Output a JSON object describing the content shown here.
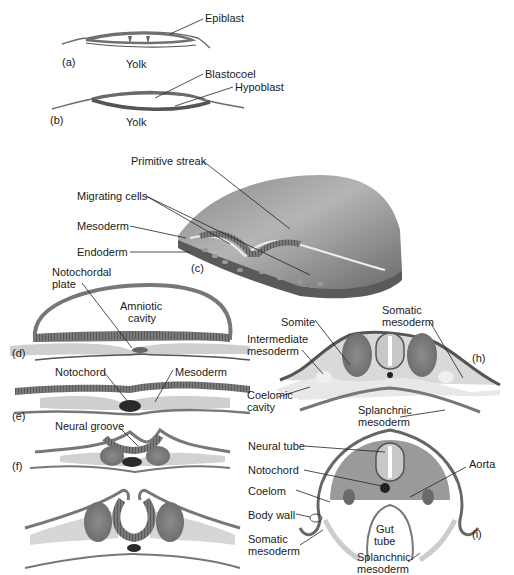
{
  "figure": {
    "panels": {
      "a": {
        "tag": "(a)",
        "yolk": "Yolk",
        "epiblast": "Epiblast"
      },
      "b": {
        "tag": "(b)",
        "yolk": "Yolk",
        "blastocoel": "Blastocoel",
        "hypoblast": "Hypoblast"
      },
      "c": {
        "tag": "(c)",
        "primitive_streak": "Primitive streak",
        "migrating_cells": "Migrating cells",
        "mesoderm": "Mesoderm",
        "endoderm": "Endoderm"
      },
      "d": {
        "tag": "(d)",
        "notochordal_plate_1": "Notochordal",
        "notochordal_plate_2": "plate",
        "amniotic_1": "Amniotic",
        "amniotic_2": "cavity"
      },
      "e": {
        "tag": "(e)",
        "notochord": "Notochord",
        "mesoderm": "Mesoderm"
      },
      "f": {
        "tag": "(f)",
        "neural_groove": "Neural groove"
      },
      "h": {
        "tag": "(h)",
        "somite": "Somite",
        "somatic_1": "Somatic",
        "somatic_2": "mesoderm",
        "intermediate_1": "Intermediate",
        "intermediate_2": "mesoderm",
        "coelomic_1": "Coelomic",
        "coelomic_2": "cavity",
        "splanchnic_1": "Splanchnic",
        "splanchnic_2": "mesoderm"
      },
      "i": {
        "tag": "(i)",
        "neural_tube": "Neural tube",
        "notochord": "Notochord",
        "aorta": "Aorta",
        "coelom": "Coelom",
        "body_wall": "Body wall",
        "gut_1": "Gut",
        "gut_2": "tube",
        "somatic_1": "Somatic",
        "somatic_2": "mesoderm",
        "splanchnic_1": "Splanchnic",
        "splanchnic_2": "mesoderm"
      }
    },
    "colors": {
      "tissue_dark": "#6e6e6e",
      "tissue_mid": "#9a9a9a",
      "tissue_light": "#c9c9c9",
      "tissue_pale": "#e2e2e2",
      "notochord": "#2a2a2a",
      "leader": "#222222"
    }
  }
}
